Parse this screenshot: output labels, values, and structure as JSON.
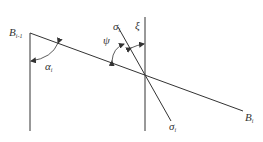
{
  "diagram": {
    "labels": {
      "b_prev": {
        "base": "B",
        "sub": "i-1"
      },
      "b_curr": {
        "base": "B",
        "sub": "i"
      },
      "alpha": {
        "base": "α",
        "sub": "i"
      },
      "psi": {
        "base": "ψ",
        "sub": ""
      },
      "xi": {
        "base": "ξ",
        "sub": ""
      },
      "sigma_top": {
        "base": "σ",
        "sub": "i"
      },
      "sigma_bottom": {
        "base": "σ",
        "sub": "i"
      }
    },
    "colors": {
      "line": "#333333",
      "background": "#ffffff"
    }
  }
}
